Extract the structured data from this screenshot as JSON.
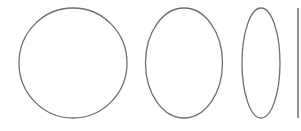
{
  "diagram": {
    "stroke_color": "#6e6e6e",
    "background": "#ffffff",
    "shapes": [
      {
        "name": "circle",
        "cx": 73,
        "cy": 63,
        "rx": 54,
        "ry": 55
      },
      {
        "name": "wide-ellipse",
        "cx": 184,
        "cy": 63,
        "rx": 38.5,
        "ry": 55
      },
      {
        "name": "narrow-ellipse",
        "cx": 261,
        "cy": 63,
        "rx": 19,
        "ry": 55
      },
      {
        "name": "vertical-line",
        "x": 298,
        "y1": 8,
        "y2": 118
      }
    ]
  }
}
